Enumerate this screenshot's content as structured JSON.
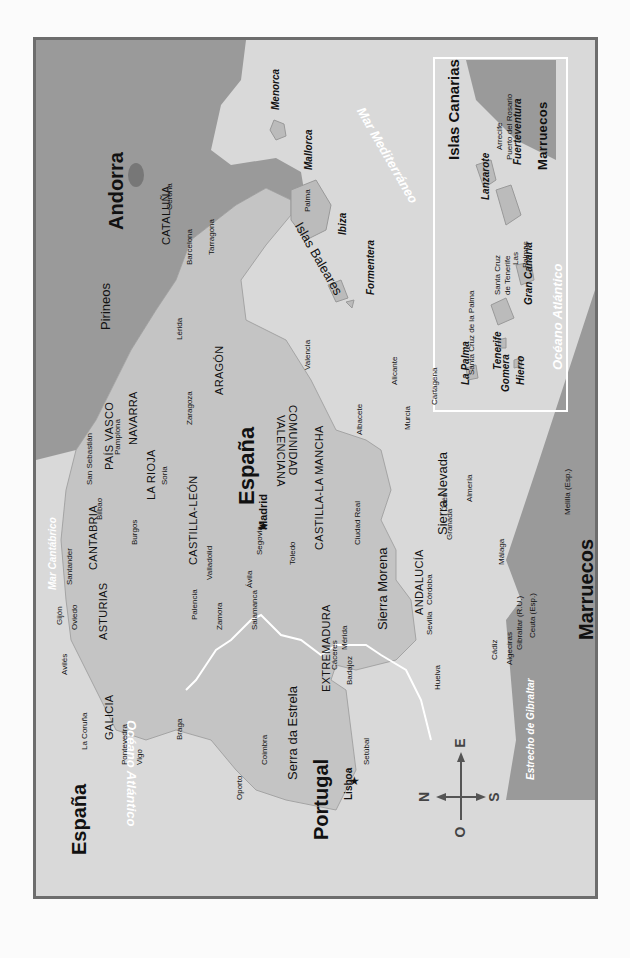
{
  "map": {
    "orientation": "rotated 90 degrees clockwise (north points left)",
    "countries": {
      "espana_main": "España",
      "espana_corner": "España",
      "portugal": "Portugal",
      "andorra": "Andorra",
      "marruecos_main": "Marruecos",
      "marruecos_inset": "Marruecos"
    },
    "seas": {
      "mediterraneo": "Mar Mediterráneo",
      "cantabrico": "Mar Cantábrico",
      "atlantico_main": "Océano Atlántico",
      "atlantico_inset": "Océano Atlántico",
      "gibraltar_strait": "Estrecho de Gibraltar"
    },
    "mountains": {
      "pirineos": "Pirineos",
      "sierra_morena": "Sierra Morena",
      "sierra_nevada": "Sierra Nevada",
      "serra_estrela": "Serra da Estrela"
    },
    "regions": {
      "galicia": "GALICIA",
      "asturias": "ASTURIAS",
      "cantabria": "CANTABRIA",
      "pais_vasco": "PAÍS VASCO",
      "navarra": "NAVARRA",
      "la_rioja": "LA RIOJA",
      "aragon": "ARAGÓN",
      "cataluna": "CATALUÑA",
      "castilla_leon": "CASTILLA-LEÓN",
      "castilla_mancha": "CASTILLA-LA MANCHA",
      "comunidad_valenciana_1": "COMUNIDAD",
      "comunidad_valenciana_2": "VALENCIANA",
      "extremadura": "EXTREMADURA",
      "andalucia": "ANDALUCÍA"
    },
    "capitals": {
      "madrid": "Madrid",
      "lisboa": "Lisboa"
    },
    "cities": {
      "gerona": "Gerona",
      "barcelona": "Barcelona",
      "tarragona": "Tarragona",
      "lerida": "Lérida",
      "zaragoza": "Zaragoza",
      "valencia": "Valencia",
      "alicante": "Alicante",
      "cartagena": "Cartagena",
      "murcia": "Murcia",
      "albacete": "Albacete",
      "pamplona": "Pamplona",
      "san_sebastian": "San Sebastián",
      "bilbao": "Bilbao",
      "santander": "Santander",
      "soria": "Soria",
      "burgos": "Burgos",
      "gijon": "Gijón",
      "oviedo": "Oviedo",
      "aviles": "Avilés",
      "la_coruna": "La Coruña",
      "pontevedra": "Pontevedra",
      "vigo": "Vigo",
      "braga": "Braga",
      "oporto": "Oporto",
      "coimbra": "Coimbra",
      "setubal": "Setúbal",
      "palencia": "Palencia",
      "valladolid": "Valladolid",
      "zamora": "Zamora",
      "salamanca": "Salamanca",
      "segovia": "Segovia",
      "avila": "Ávila",
      "toledo": "Toledo",
      "ciudad_real": "Ciudad Real",
      "caceres": "Cáceres",
      "merida": "Mérida",
      "badajoz": "Badajoz",
      "huelva": "Huelva",
      "sevilla": "Sevilla",
      "cordoba": "Córdoba",
      "jaen": "Jaén",
      "granada": "Granada",
      "almeria": "Almería",
      "malaga": "Málaga",
      "cadiz": "Cádiz",
      "algeciras": "Algeciras",
      "gibraltar": "Gibraltar (R.U.)",
      "ceuta": "Ceuta (Esp.)",
      "melilla": "Melilla (Esp.)",
      "palma": "Palma"
    },
    "baleares": {
      "group": "Islas Baleares",
      "menorca": "Menorca",
      "mallorca": "Mallorca",
      "ibiza": "Ibiza",
      "formentera": "Formentera"
    },
    "canarias": {
      "title": "Islas Canarias",
      "lanzarote": "Lanzarote",
      "fuerteventura": "Fuerteventura",
      "gran_canaria": "Gran Canaria",
      "tenerife": "Tenerife",
      "la_palma": "La Palma",
      "gomera": "Gomera",
      "hierro": "Hierro",
      "arrecife": "Arrecife",
      "puerto_rosario": "Puerto del Rosario",
      "las_palmas_1": "Las",
      "las_palmas_2": "Palmas",
      "santa_cruz_tenerife_1": "Santa Cruz",
      "santa_cruz_tenerife_2": "de Tenerife",
      "santa_cruz_palma": "Santa Cruz de la Palma"
    },
    "compass": {
      "north": "N",
      "south": "S",
      "east": "E",
      "west": "O"
    },
    "colors": {
      "sea": "#d9d9d9",
      "land": "#c4c4c4",
      "other_land": "#9a9a9a",
      "frame": "#6d6d6d",
      "border_line": "#ffffff"
    }
  }
}
